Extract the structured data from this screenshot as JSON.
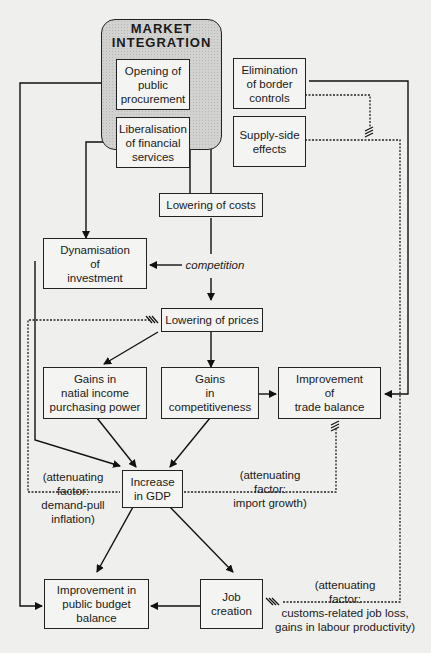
{
  "market_integration": {
    "title": "MARKET\nINTEGRATION",
    "items": [
      {
        "id": "opening",
        "label": "Opening of\npublic\nprocurement"
      },
      {
        "id": "elimination",
        "label": "Elimination\nof border\ncontrols"
      },
      {
        "id": "liberalisation",
        "label": "Liberalisation\nof financial\nservices"
      },
      {
        "id": "supply",
        "label": "Supply-side\neffects"
      }
    ]
  },
  "nodes": {
    "lowering_costs": "Lowering of costs",
    "competition": "competition",
    "dynamisation": "Dynamisation\nof\ninvestment",
    "lowering_prices": "Lowering of prices",
    "gains_income": "Gains in\nnatial income\npurchasing power",
    "gains_competitiveness": "Gains\nin\ncompetitiveness",
    "trade_balance": "Improvement\nof\ntrade balance",
    "gdp": "Increase\nin GDP",
    "budget": "Improvement in\npublic budget\nbalance",
    "jobs": "Job\ncreation"
  },
  "annotations": {
    "demand_pull": "(attenuating\nfactor:\ndemand-pull\ninflation)",
    "import_growth": "(attenuating\nfactor:\nimport growth)",
    "job_loss": "(attenuating\nfactor:\ncustoms-related job loss,\ngains in labour productivity)"
  }
}
